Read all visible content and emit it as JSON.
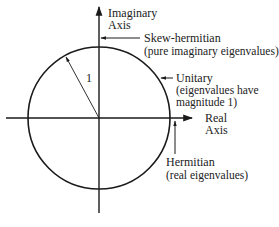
{
  "diagram": {
    "axes": {
      "imaginary": {
        "line1": "Imaginary",
        "line2": "Axis"
      },
      "real": {
        "line1": "Real",
        "line2": "Axis"
      }
    },
    "unit_circle": {
      "radius_label": "1"
    },
    "annotations": {
      "skew_hermitian": {
        "line1": "Skew-hermitian",
        "line2": "(pure imaginary eigenvalues)"
      },
      "unitary": {
        "line1": "Unitary",
        "line2": "(eigenvalues have",
        "line3": "magnitude 1)"
      },
      "hermitian": {
        "line1": "Hermitian",
        "line2": "(real eigenvalues)"
      }
    },
    "colors": {
      "ink": "#1a1a1a",
      "background": "#ffffff"
    }
  }
}
